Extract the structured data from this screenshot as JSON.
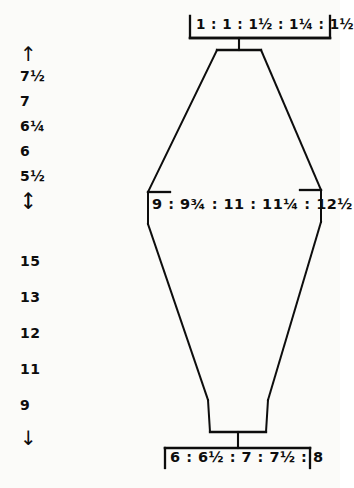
{
  "diagram": {
    "type": "hand-drawn garment schematic",
    "shape_name": "tapered body panel",
    "measurements": {
      "top_label": "1 : 1 : 1½ : 1¼ : 1½",
      "middle_label": "9 : 9¾ : 11 : 11¼ : 12½",
      "bottom_label": "6 : 6½ : 7 : 7½ : 8"
    },
    "top_sizes": [
      "1",
      "1",
      "1½",
      "1¼",
      "1½"
    ],
    "middle_sizes": [
      "9",
      "9¾",
      "11",
      "11¼",
      "12½"
    ],
    "bottom_sizes": [
      "6",
      "6½",
      "7",
      "7½",
      "8"
    ]
  },
  "upper_scale": {
    "top_arrow": "↑",
    "bottom_arrow": "↓",
    "values": [
      "7½",
      "7",
      "6¼",
      "6",
      "5½"
    ]
  },
  "lower_scale": {
    "top_arrow": "↑",
    "bottom_arrow": "↓",
    "values": [
      "15",
      "13",
      "12",
      "11",
      "9"
    ]
  },
  "colors": {
    "ink": "#0d0d0d",
    "paper": "#fbfbf9"
  }
}
